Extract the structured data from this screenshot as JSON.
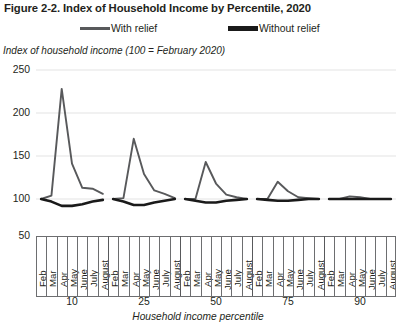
{
  "figure": {
    "title": "Figure 2-2. Index of Household Income by Percentile, 2020",
    "y_axis_note": "Index of household income (100 = February 2020)",
    "x_axis_title": "Household income percentile"
  },
  "legend": {
    "position": "top-center",
    "entries": [
      {
        "label": "With relief",
        "color": "#58595b",
        "style": "thin"
      },
      {
        "label": "Without relief",
        "color": "#1a1a1a",
        "style": "thick"
      }
    ]
  },
  "colors": {
    "with_relief": "#58595b",
    "without_relief": "#1a1a1a",
    "gridline": "#e3e3e3",
    "axis": "#6d6e70",
    "text": "#231f20"
  },
  "chart_data": {
    "type": "line",
    "title": "Figure 2-2. Index of Household Income by Percentile, 2020",
    "subtitle": "",
    "xlabel": "Household income percentile",
    "ylabel": "Index of household income (100 = February 2020)",
    "ylim": [
      50,
      250
    ],
    "yticks": [
      250,
      200,
      150,
      100,
      50
    ],
    "grid": true,
    "legend_position": "top-center",
    "months": [
      "Feb",
      "Mar",
      "Apr",
      "May",
      "June",
      "July",
      "August"
    ],
    "percentile_groups": [
      "10",
      "25",
      "50",
      "75",
      "90"
    ],
    "series": [
      {
        "name": "With relief",
        "color": "#58595b",
        "groups": [
          {
            "percentile": "10",
            "values": [
              100,
              104,
              228,
              141,
              113,
              112,
              106
            ]
          },
          {
            "percentile": "25",
            "values": [
              100,
              101,
              170,
              129,
              110,
              106,
              101
            ]
          },
          {
            "percentile": "50",
            "values": [
              100,
              100,
              143,
              118,
              105,
              102,
              100
            ]
          },
          {
            "percentile": "75",
            "values": [
              100,
              100,
              120,
              109,
              102,
              101,
              100
            ]
          },
          {
            "percentile": "90",
            "values": [
              100,
              100,
              103,
              102,
              100,
              100,
              100
            ]
          }
        ]
      },
      {
        "name": "Without relief",
        "color": "#1a1a1a",
        "groups": [
          {
            "percentile": "10",
            "values": [
              100,
              97,
              92,
              92,
              94,
              97,
              99
            ]
          },
          {
            "percentile": "25",
            "values": [
              100,
              97,
              93,
              93,
              96,
              98,
              100
            ]
          },
          {
            "percentile": "50",
            "values": [
              100,
              98,
              96,
              96,
              98,
              99,
              100
            ]
          },
          {
            "percentile": "75",
            "values": [
              100,
              99,
              98,
              98,
              99,
              100,
              100
            ]
          },
          {
            "percentile": "90",
            "values": [
              100,
              100,
              100,
              100,
              100,
              100,
              100
            ]
          }
        ]
      }
    ]
  }
}
